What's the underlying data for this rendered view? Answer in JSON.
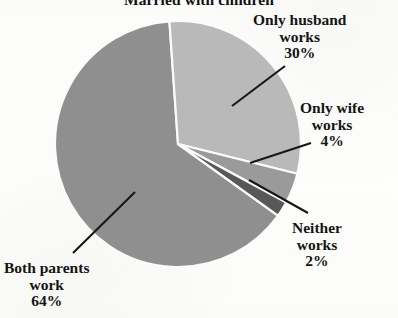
{
  "title": "Married with children",
  "chart_data": {
    "type": "pie",
    "title": "Married with children",
    "categories": [
      "Only husband works",
      "Only wife works",
      "Neither works",
      "Both parents work"
    ],
    "values": [
      30,
      4,
      2,
      64
    ],
    "value_labels": [
      "30%",
      "4%",
      "2%",
      "64%"
    ],
    "unit": "%",
    "total": 100,
    "legend": "none",
    "grid": false,
    "colors": [
      "#b9b9b9",
      "#9a9a9a",
      "#595959",
      "#8f8f8f"
    ],
    "slices": [
      {
        "name": "Only husband works",
        "label_line1": "Only husband",
        "label_line2": "works",
        "percent_text": "30%",
        "value": 30,
        "color": "#b9b9b9",
        "start_angle_deg": -4,
        "sweep_deg": 108
      },
      {
        "name": "Only wife works",
        "label_line1": "Only wife",
        "label_line2": "works",
        "percent_text": "4%",
        "value": 4,
        "color": "#9a9a9a",
        "start_angle_deg": 104,
        "sweep_deg": 14.4
      },
      {
        "name": "Neither works",
        "label_line1": "Neither",
        "label_line2": "works",
        "percent_text": "2%",
        "value": 2,
        "color": "#595959",
        "start_angle_deg": 118.4,
        "sweep_deg": 7.2
      },
      {
        "name": "Both parents work",
        "label_line1": "Both parents",
        "label_line2": "work",
        "percent_text": "64%",
        "value": 64,
        "color": "#8f8f8f",
        "start_angle_deg": 125.6,
        "sweep_deg": 230.4
      }
    ]
  }
}
